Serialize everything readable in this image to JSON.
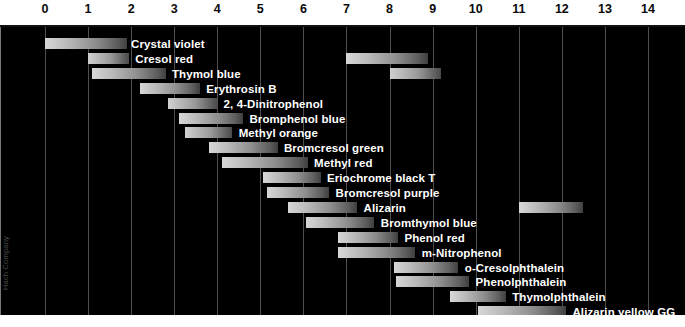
{
  "axis": {
    "label": "pH",
    "ticks": [
      0,
      1,
      2,
      3,
      4,
      5,
      6,
      7,
      8,
      9,
      10,
      11,
      12,
      13,
      14
    ],
    "min": 0,
    "max": 14
  },
  "credit": "Hach Company",
  "colors": {
    "background": "#000000",
    "band": "#ffffff",
    "gridline": "#6e6e6e",
    "label_text": "#ffffff",
    "tick_text": "#0a0a0a"
  },
  "chart_data": {
    "type": "bar",
    "title": "",
    "xlabel": "pH",
    "ylabel": "",
    "xlim": [
      0,
      14
    ],
    "grid": true,
    "legend": "none",
    "orientation": "horizontal",
    "note": "pH transition ranges of acid-base indicators; each bar spans the indicator's colour-change interval",
    "categories": [
      "Crystal violet",
      "Cresol red",
      "Thymol blue",
      "Erythrosin B",
      "2, 4-Dinitrophenol",
      "Bromphenol blue",
      "Methyl orange",
      "Bromcresol green",
      "Methyl red",
      "Eriochrome black T",
      "Bromcresol purple",
      "Alizarin",
      "Bromthymol blue",
      "Phenol red",
      "m-Nitrophenol",
      "o-Cresolphthalein",
      "Phenolphthalein",
      "Thymolphthalein",
      "Alizarin yellow GG"
    ],
    "rows": [
      {
        "name": "Crystal violet",
        "ranges": [
          [
            0.0,
            1.9
          ]
        ],
        "label_x": 1.95
      },
      {
        "name": "Cresol red",
        "ranges": [
          [
            1.0,
            1.95
          ],
          [
            7.0,
            8.9
          ]
        ],
        "label_x": 2.05
      },
      {
        "name": "Thymol blue",
        "ranges": [
          [
            1.1,
            2.8
          ],
          [
            8.0,
            9.2
          ]
        ],
        "label_x": 2.9
      },
      {
        "name": "Erythrosin B",
        "ranges": [
          [
            2.2,
            3.6
          ]
        ],
        "label_x": 3.7
      },
      {
        "name": "2, 4-Dinitrophenol",
        "ranges": [
          [
            2.85,
            4.0
          ]
        ],
        "label_x": 4.1
      },
      {
        "name": "Bromphenol blue",
        "ranges": [
          [
            3.1,
            4.6
          ]
        ],
        "label_x": 4.7
      },
      {
        "name": "Methyl orange",
        "ranges": [
          [
            3.25,
            4.35
          ]
        ],
        "label_x": 4.45
      },
      {
        "name": "Bromcresol green",
        "ranges": [
          [
            3.8,
            5.4
          ]
        ],
        "label_x": 5.5
      },
      {
        "name": "Methyl red",
        "ranges": [
          [
            4.1,
            6.1
          ]
        ],
        "label_x": 6.2
      },
      {
        "name": "Eriochrome black T",
        "ranges": [
          [
            5.05,
            6.4
          ]
        ],
        "label_x": 6.5
      },
      {
        "name": "Bromcresol purple",
        "ranges": [
          [
            5.15,
            6.6
          ]
        ],
        "label_x": 6.7
      },
      {
        "name": "Alizarin",
        "ranges": [
          [
            5.65,
            7.25
          ],
          [
            11.0,
            12.5
          ]
        ],
        "label_x": 7.35
      },
      {
        "name": "Bromthymol blue",
        "ranges": [
          [
            6.05,
            7.65
          ]
        ],
        "label_x": 7.75
      },
      {
        "name": "Phenol red",
        "ranges": [
          [
            6.8,
            8.2
          ]
        ],
        "label_x": 8.3
      },
      {
        "name": "m-Nitrophenol",
        "ranges": [
          [
            6.8,
            8.6
          ]
        ],
        "label_x": 8.7
      },
      {
        "name": "o-Cresolphthalein",
        "ranges": [
          [
            8.1,
            9.6
          ]
        ],
        "label_x": 9.7
      },
      {
        "name": "Phenolphthalein",
        "ranges": [
          [
            8.15,
            9.85
          ]
        ],
        "label_x": 9.95
      },
      {
        "name": "Thymolphthalein",
        "ranges": [
          [
            9.4,
            10.7
          ]
        ],
        "label_x": 10.8
      },
      {
        "name": "Alizarin yellow GG",
        "ranges": [
          [
            10.05,
            12.1
          ]
        ],
        "label_x": 12.2
      }
    ]
  }
}
